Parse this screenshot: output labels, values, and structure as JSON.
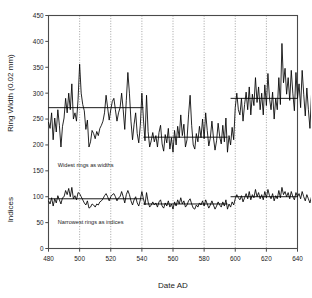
{
  "chart_data": {
    "type": "line",
    "title": "",
    "xlabel": "Date AD",
    "ylabel_top": "Ring Width (0.02 mm)",
    "ylabel_bottom": "Indices",
    "xlim": [
      480,
      640
    ],
    "ylim": [
      0,
      450
    ],
    "xticks": [
      480,
      500,
      520,
      540,
      560,
      580,
      600,
      620,
      640
    ],
    "yticks": [
      0,
      50,
      100,
      150,
      200,
      250,
      300,
      350,
      400,
      450
    ],
    "grid": "vertical dotted gridlines at each x tick",
    "legend": "none",
    "annotations": [
      {
        "text": "Widest rings as widths",
        "x": 486,
        "y": 158
      },
      {
        "text": "Narrowest rings as indices",
        "x": 486,
        "y": 47
      }
    ],
    "series": [
      {
        "name": "Ring width (0.02 mm)",
        "type": "line",
        "color": "#000000",
        "x_start": 480,
        "x_step": 1,
        "values": [
          244,
          232,
          262,
          210,
          252,
          225,
          268,
          238,
          196,
          236,
          252,
          290,
          262,
          300,
          268,
          318,
          250,
          262,
          246,
          288,
          356,
          300,
          278,
          266,
          230,
          248,
          196,
          206,
          228,
          222,
          212,
          226,
          218,
          232,
          238,
          246,
          262,
          296,
          272,
          248,
          268,
          284,
          290,
          268,
          246,
          262,
          272,
          300,
          268,
          230,
          286,
          340,
          300,
          246,
          210,
          240,
          262,
          222,
          204,
          238,
          300,
          250,
          208,
          296,
          226,
          196,
          208,
          224,
          206,
          218,
          196,
          224,
          238,
          202,
          188,
          220,
          204,
          232,
          192,
          214,
          186,
          228,
          200,
          236,
          214,
          258,
          218,
          240,
          196,
          210,
          258,
          296,
          238,
          200,
          192,
          222,
          206,
          236,
          214,
          250,
          212,
          262,
          228,
          198,
          214,
          246,
          214,
          190,
          208,
          242,
          216,
          202,
          238,
          206,
          252,
          186,
          218,
          200,
          234,
          210,
          272,
          300,
          268,
          258,
          290,
          246,
          278,
          302,
          268,
          312,
          258,
          298,
          276,
          330,
          282,
          312,
          268,
          300,
          258,
          316,
          276,
          338,
          290,
          268,
          302,
          250,
          290,
          268,
          330,
          278,
          396,
          320,
          348,
          298,
          330,
          286,
          344,
          300,
          266,
          340,
          290,
          318,
          272,
          344,
          298,
          256,
          310,
          268,
          232,
          298
        ]
      },
      {
        "name": "Indices",
        "type": "line",
        "color": "#000000",
        "x_start": 480,
        "x_step": 1,
        "values": [
          92,
          86,
          98,
          82,
          96,
          88,
          102,
          94,
          86,
          98,
          100,
          112,
          104,
          116,
          100,
          118,
          96,
          102,
          94,
          108,
          106,
          100,
          94,
          88,
          84,
          92,
          78,
          80,
          86,
          84,
          80,
          86,
          84,
          90,
          92,
          96,
          102,
          106,
          100,
          92,
          100,
          104,
          106,
          100,
          92,
          98,
          100,
          110,
          100,
          88,
          104,
          112,
          104,
          92,
          84,
          94,
          100,
          88,
          82,
          94,
          110,
          96,
          84,
          108,
          90,
          80,
          84,
          90,
          84,
          88,
          80,
          90,
          94,
          82,
          78,
          88,
          82,
          92,
          80,
          86,
          76,
          90,
          82,
          94,
          86,
          98,
          86,
          92,
          80,
          84,
          92,
          96,
          86,
          78,
          76,
          84,
          80,
          88,
          84,
          92,
          82,
          94,
          86,
          78,
          84,
          92,
          84,
          76,
          82,
          90,
          84,
          80,
          90,
          82,
          94,
          76,
          86,
          80,
          90,
          84,
          96,
          104,
          98,
          94,
          102,
          90,
          98,
          106,
          96,
          110,
          94,
          104,
          98,
          114,
          100,
          108,
          96,
          104,
          94,
          110,
          98,
          114,
          102,
          96,
          106,
          92,
          102,
          96,
          112,
          98,
          118,
          104,
          110,
          100,
          108,
          96,
          110,
          100,
          94,
          108,
          100,
          106,
          96,
          110,
          100,
          92,
          104,
          96,
          88,
          100
        ]
      },
      {
        "name": "Ring width segment means",
        "type": "step-line",
        "color": "#000000",
        "segments": [
          {
            "x0": 480,
            "x1": 520,
            "y": 272
          },
          {
            "x0": 520,
            "x1": 541,
            "y": 272
          },
          {
            "x0": 541,
            "x1": 595,
            "y": 215
          },
          {
            "x0": 597,
            "x1": 640,
            "y": 290
          }
        ]
      },
      {
        "name": "Indices segment means",
        "type": "step-line",
        "color": "#000000",
        "segments": [
          {
            "x0": 480,
            "x1": 541,
            "y": 96
          },
          {
            "x0": 541,
            "x1": 595,
            "y": 86
          },
          {
            "x0": 597,
            "x1": 640,
            "y": 100
          }
        ]
      }
    ]
  },
  "axes": {
    "x_tick_labels": [
      "480",
      "500",
      "520",
      "540",
      "560",
      "580",
      "600",
      "620",
      "640"
    ],
    "y_tick_labels": [
      "0",
      "50",
      "100",
      "150",
      "200",
      "250",
      "300",
      "350",
      "400",
      "450"
    ],
    "x_title": "Date AD",
    "y_title_top": "Ring Width (0.02 mm)",
    "y_title_bottom": "Indices"
  },
  "annotations": {
    "widest": "Widest rings as widths",
    "narrowest": "Narrowest rings as indices"
  },
  "colors": {
    "series": "#000000",
    "axis": "#4a4a4a",
    "grid": "#8a8a8a",
    "text": "#1a1a1a",
    "background": "#ffffff"
  }
}
